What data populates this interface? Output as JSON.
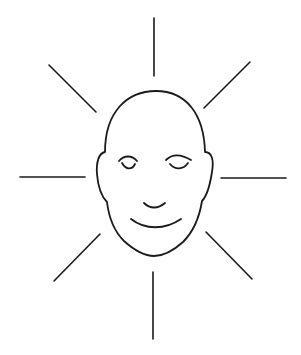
{
  "illustration": {
    "subject": "smiling bald face with closed eyes surrounded by radiating lines",
    "background_color": "#ffffff",
    "line_color": "#1a1a1a",
    "ray_count": 8
  }
}
